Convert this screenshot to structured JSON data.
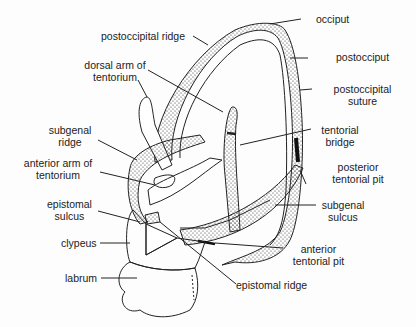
{
  "diagram": {
    "labels": {
      "occiput": "occiput",
      "postoccipital_ridge": "postoccipital ridge",
      "postocciput": "postocciput",
      "dorsal_arm_1": "dorsal arm of",
      "dorsal_arm_2": "tentorium",
      "postoccipital_suture_1": "postoccipital",
      "postoccipital_suture_2": "suture",
      "subgenal_ridge_1": "subgenal",
      "subgenal_ridge_2": "ridge",
      "tentorial_bridge_1": "tentorial",
      "tentorial_bridge_2": "bridge",
      "anterior_arm_1": "anterior arm of",
      "anterior_arm_2": "tentorium",
      "posterior_pit_1": "posterior",
      "posterior_pit_2": "tentorial pit",
      "epistomal_sulcus_1": "epistomal",
      "epistomal_sulcus_2": "sulcus",
      "subgenal_sulcus_1": "subgenal",
      "subgenal_sulcus_2": "sulcus",
      "clypeus": "clypeus",
      "anterior_pit_1": "anterior",
      "anterior_pit_2": "tentorial pit",
      "labrum": "labrum",
      "epistomal_ridge": "epistomal ridge"
    }
  }
}
